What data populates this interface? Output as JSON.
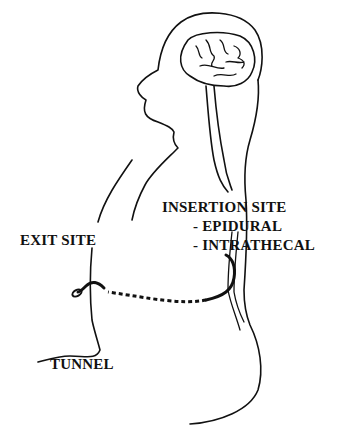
{
  "diagram": {
    "labels": {
      "insertion_site": "INSERTION SITE",
      "epidural": "-  EPIDURAL",
      "intrathecal": "-  INTRATHECAL",
      "exit_site": "EXIT SITE",
      "tunnel": "TUNNEL"
    },
    "colors": {
      "line": "#111111",
      "background": "#ffffff"
    }
  }
}
